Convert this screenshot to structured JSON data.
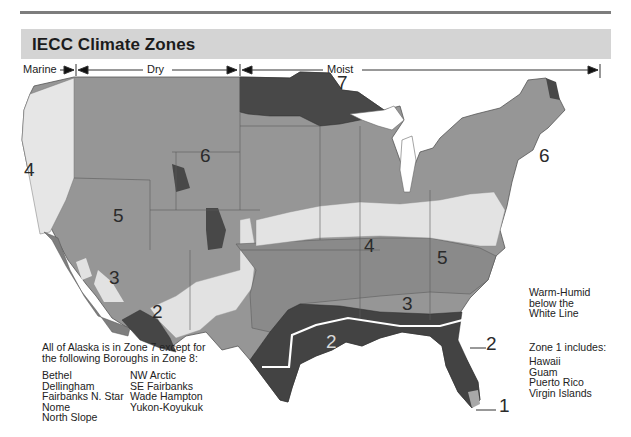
{
  "header": {
    "title": "IECC Climate Zones"
  },
  "moisture_regimes": [
    {
      "label": "Marine",
      "x": 22
    },
    {
      "label": "Dry",
      "x": 146
    },
    {
      "label": "Moist",
      "x": 326
    }
  ],
  "zone_labels": [
    {
      "zone": "1",
      "x": 584,
      "y": 345
    },
    {
      "zone": "2",
      "x": 138,
      "y": 245
    },
    {
      "zone": "2",
      "x": 325,
      "y": 282
    },
    {
      "zone": "2",
      "x": 486,
      "y": 350
    },
    {
      "zone": "3",
      "x": 109,
      "y": 205
    },
    {
      "zone": "3",
      "x": 402,
      "y": 238
    },
    {
      "zone": "4",
      "x": 20,
      "y": 102
    },
    {
      "zone": "4",
      "x": 364,
      "y": 183
    },
    {
      "zone": "5",
      "x": 113,
      "y": 149
    },
    {
      "zone": "5",
      "x": 437,
      "y": 183
    },
    {
      "zone": "6",
      "x": 200,
      "y": 86
    },
    {
      "zone": "6",
      "x": 539,
      "y": 94
    },
    {
      "zone": "7",
      "x": 336,
      "y": 19
    }
  ],
  "alaska_note": {
    "line1": "All of Alaska is in Zone 7 except for",
    "line2": "the following Boroughs in Zone 8:",
    "boroughs_col1": [
      "Bethel",
      "Dellingham",
      "Fairbanks N. Star",
      "Nome",
      "North Slope"
    ],
    "boroughs_col2": [
      "NW Arctic",
      "SE Fairbanks",
      "Wade Hampton",
      "Yukon-Koyukuk"
    ]
  },
  "warm_humid_note": {
    "line1": "Warm-Humid",
    "line2": "below the",
    "line3": "White Line"
  },
  "zone1_note": {
    "heading": "Zone 1 includes:",
    "items": [
      "Hawaii",
      "Guam",
      "Puerto Rico",
      "Virgin Islands"
    ]
  },
  "colors": {
    "zone1": "#a8a8a8",
    "zone2": "#474747",
    "zone3": "#8a8a8a",
    "zone4": "#e4e4e4",
    "zone5": "#9a9a9a",
    "zone6": "#939393",
    "zone7": "#4a4a4a",
    "title_bar": "#d4d4d4",
    "rule": "#7d7d7d"
  }
}
